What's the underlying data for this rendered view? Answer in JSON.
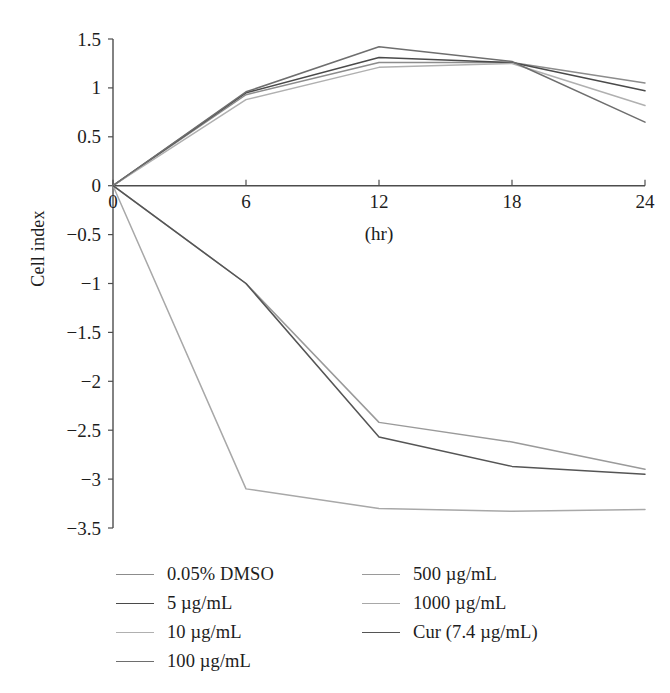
{
  "chart_data": {
    "type": "line",
    "title": "",
    "xlabel": "(hr)",
    "ylabel": "Cell index",
    "x": [
      0,
      6,
      12,
      18,
      24
    ],
    "xticks": [
      0,
      6,
      12,
      18,
      24
    ],
    "yticks": [
      1.5,
      1,
      0.5,
      0,
      -0.5,
      -1,
      -1.5,
      -2,
      -2.5,
      -3,
      -3.5
    ],
    "ytick_labels": [
      "1.5",
      "1",
      "0.5",
      "0",
      "−0.5",
      "−1",
      "−1.5",
      "−2",
      "−2.5",
      "−3",
      "−3.5"
    ],
    "xtick_labels": [
      "0",
      "6",
      "12",
      "18",
      "24"
    ],
    "xlim": [
      0,
      24
    ],
    "ylim": [
      -3.5,
      1.5
    ],
    "grid": false,
    "legend_position": "below-plot",
    "series": [
      {
        "name": "0.05% DMSO",
        "color": "#8c8c8c",
        "values": [
          0,
          0.93,
          1.26,
          1.26,
          1.05
        ]
      },
      {
        "name": "5 µg/mL",
        "color": "#4a4a4a",
        "values": [
          0,
          0.95,
          1.31,
          1.26,
          0.97
        ]
      },
      {
        "name": "10 µg/mL",
        "color": "#b0b0b0",
        "values": [
          0,
          0.88,
          1.21,
          1.25,
          0.82
        ]
      },
      {
        "name": "100 µg/mL",
        "color": "#6e6e6e",
        "values": [
          0,
          0.96,
          1.42,
          1.27,
          0.65
        ]
      },
      {
        "name": "500 µg/mL",
        "color": "#9a9a9a",
        "values": [
          0,
          -1.0,
          -2.42,
          -2.62,
          -2.9
        ]
      },
      {
        "name": "1000 µg/mL",
        "color": "#a8a8a8",
        "values": [
          0,
          -3.1,
          -3.3,
          -3.33,
          -3.31
        ]
      },
      {
        "name": "Cur (7.4 µg/mL)",
        "color": "#555555",
        "values": [
          0,
          -1.0,
          -2.57,
          -2.87,
          -2.95
        ]
      }
    ]
  },
  "legend": {
    "columns": [
      {
        "items": [
          {
            "label": "0.05% DMSO",
            "color": "#8c8c8c"
          },
          {
            "label": "5 µg/mL",
            "color": "#4a4a4a"
          },
          {
            "label": "10 µg/mL",
            "color": "#b0b0b0"
          },
          {
            "label": "100 µg/mL",
            "color": "#6e6e6e"
          }
        ]
      },
      {
        "items": [
          {
            "label": "500 µg/mL",
            "color": "#9a9a9a"
          },
          {
            "label": "1000 µg/mL",
            "color": "#a8a8a8"
          },
          {
            "label": "Cur (7.4 µg/mL)",
            "color": "#555555"
          }
        ]
      }
    ]
  },
  "axes": {
    "y_title": "Cell index",
    "x_title": "(hr)",
    "axis_color": "#4d4d4d"
  }
}
